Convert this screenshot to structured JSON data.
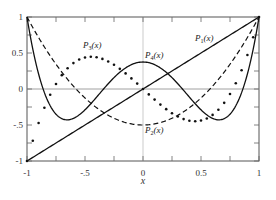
{
  "chart_data": {
    "type": "line",
    "title": "",
    "xlabel": "x",
    "ylabel": "",
    "xlim": [
      -1,
      1
    ],
    "ylim": [
      -1,
      1
    ],
    "grid": false,
    "zero_line": true,
    "x_ticks": [
      -1,
      -0.75,
      -0.5,
      -0.25,
      0,
      0.25,
      0.5,
      0.75,
      1
    ],
    "x_tick_labels": [
      {
        "value": -1,
        "label": "-1"
      },
      {
        "value": -0.5,
        "label": "-.5"
      },
      {
        "value": 0,
        "label": "0"
      },
      {
        "value": 0.5,
        "label": "0.5"
      },
      {
        "value": 1,
        "label": "1"
      }
    ],
    "y_ticks": [
      -1,
      -0.75,
      -0.5,
      -0.25,
      0,
      0.25,
      0.5,
      0.75,
      1
    ],
    "y_tick_labels": [
      {
        "value": 1,
        "label": "1"
      },
      {
        "value": 0.5,
        "label": "0.5"
      },
      {
        "value": 0,
        "label": "0"
      },
      {
        "value": -0.5,
        "label": "-.5"
      },
      {
        "value": -1,
        "label": "-1"
      }
    ],
    "series": [
      {
        "name": "P1(x)",
        "label_main": "P",
        "label_sub": "1",
        "label_tail": "(x)",
        "style": "solid",
        "width": 1.3,
        "label_pos": [
          195,
          41
        ],
        "x": [
          -1,
          0,
          1
        ],
        "values": [
          -1,
          0,
          1
        ]
      },
      {
        "name": "P2(x)",
        "label_main": "P",
        "label_sub": "2",
        "label_tail": "(x)",
        "style": "dashed",
        "width": 1.2,
        "label_pos": [
          145,
          133
        ],
        "x": [
          -1,
          -0.5,
          0,
          0.5,
          1
        ],
        "values": [
          1,
          -0.125,
          -0.5,
          -0.125,
          1
        ]
      },
      {
        "name": "P3(x)",
        "label_main": "P",
        "label_sub": "3",
        "label_tail": "(x)",
        "style": "dotted",
        "width": 2.2,
        "label_pos": [
          83,
          48
        ],
        "x": [
          -1,
          -0.75,
          -0.45,
          0,
          0.45,
          0.75,
          1
        ],
        "values": [
          -1,
          0.07,
          0.44,
          0,
          -0.44,
          -0.07,
          1
        ]
      },
      {
        "name": "P4(x)",
        "label_main": "P",
        "label_sub": "4",
        "label_tail": "(x)",
        "style": "solid",
        "width": 1.3,
        "label_pos": [
          145,
          58
        ],
        "x": [
          -1,
          -0.65,
          -0.34,
          0,
          0.34,
          0.65,
          1
        ],
        "values": [
          1,
          -0.43,
          0,
          0.375,
          0,
          -0.43,
          1
        ]
      }
    ]
  }
}
